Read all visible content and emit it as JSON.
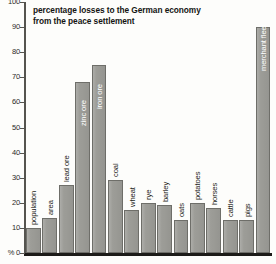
{
  "chart_data": {
    "type": "bar",
    "title": "percentage losses to the German economy from the peace settlement",
    "title_lines": [
      "percentage losses to the German economy",
      "from the peace settlement"
    ],
    "xlabel": "",
    "ylabel": "%",
    "ylim": [
      0,
      100
    ],
    "yticks": [
      0,
      10,
      20,
      30,
      40,
      50,
      60,
      70,
      80,
      90,
      100
    ],
    "ytick_labels": [
      "0",
      "10",
      "20",
      "30",
      "40",
      "50",
      "60",
      "70",
      "80",
      "90",
      "100"
    ],
    "grid": false,
    "legend": null,
    "bar_color": "#9d9d98",
    "bar_edge_color": "#6e6e69",
    "categories": [
      "population",
      "area",
      "lead ore",
      "zinc ore",
      "iron ore",
      "coal",
      "wheat",
      "rye",
      "barley",
      "oats",
      "potatoes",
      "horses",
      "cattle",
      "pigs",
      "merchant fleet"
    ],
    "values": [
      10,
      14,
      27,
      68,
      75,
      29,
      17,
      20,
      19,
      13,
      20,
      18,
      13,
      13,
      90
    ],
    "label_on_bar": [
      false,
      false,
      false,
      true,
      true,
      false,
      false,
      false,
      false,
      false,
      false,
      false,
      false,
      false,
      true
    ]
  }
}
